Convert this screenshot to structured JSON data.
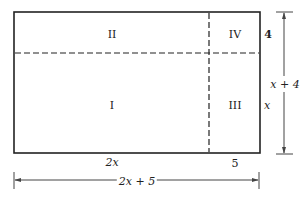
{
  "diagram": {
    "regions": [
      {
        "id": "I",
        "label": "I"
      },
      {
        "id": "II",
        "label": "II"
      },
      {
        "id": "III",
        "label": "III"
      },
      {
        "id": "IV",
        "label": "IV"
      }
    ],
    "dimensions": {
      "left_width": "2x",
      "right_width": "5",
      "top_height": "4",
      "bottom_height": "x",
      "total_height": "x + 4",
      "total_width": "2x + 5"
    },
    "colors": {
      "line": "#222222",
      "arrow": "#444444",
      "background": "#ffffff"
    }
  }
}
